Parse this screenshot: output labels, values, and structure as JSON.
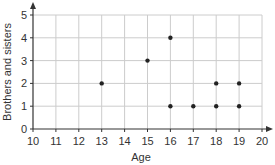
{
  "chart_data": {
    "type": "scatter",
    "title": "",
    "xlabel": "Age",
    "ylabel": "Brothers and sisters",
    "xlim": [
      10,
      20
    ],
    "ylim": [
      0,
      5
    ],
    "x_ticks": [
      10,
      11,
      12,
      13,
      14,
      15,
      16,
      17,
      18,
      19,
      20
    ],
    "y_ticks": [
      0,
      1,
      2,
      3,
      4,
      5
    ],
    "grid": true,
    "legend": null,
    "points": [
      {
        "x": 13,
        "y": 2
      },
      {
        "x": 15,
        "y": 3
      },
      {
        "x": 16,
        "y": 4
      },
      {
        "x": 16,
        "y": 1
      },
      {
        "x": 17,
        "y": 1
      },
      {
        "x": 18,
        "y": 2
      },
      {
        "x": 18,
        "y": 1
      },
      {
        "x": 19,
        "y": 2
      },
      {
        "x": 19,
        "y": 1
      }
    ]
  },
  "colors": {
    "grid": "#cccccc",
    "axis": "#333333",
    "point": "#222222"
  }
}
